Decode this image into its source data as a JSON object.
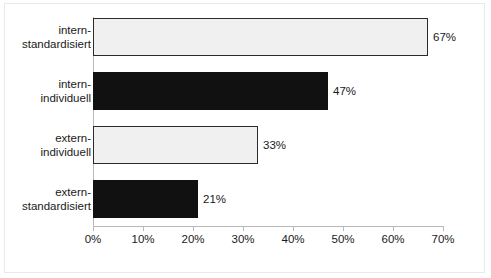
{
  "chart_data": {
    "type": "bar",
    "orientation": "horizontal",
    "title": "",
    "subtitle": "",
    "xlabel": "",
    "ylabel": "",
    "categories": [
      "intern-standardisiert",
      "intern-individuell",
      "extern-individuell",
      "extern-standardisiert"
    ],
    "category_lines": [
      [
        "intern-",
        "standardisiert"
      ],
      [
        "intern-",
        "individuell"
      ],
      [
        "extern-",
        "individuell"
      ],
      [
        "extern-",
        "standardisiert"
      ]
    ],
    "values": [
      67,
      47,
      33,
      21
    ],
    "value_labels": [
      "67%",
      "47%",
      "33%",
      "21%"
    ],
    "bar_styles": [
      "light",
      "dark",
      "light",
      "dark"
    ],
    "xlim": [
      0,
      70
    ],
    "xticks": [
      0,
      10,
      20,
      30,
      40,
      50,
      60,
      70
    ],
    "xtick_labels": [
      "0%",
      "10%",
      "20%",
      "30%",
      "40%",
      "50%",
      "60%",
      "70%"
    ],
    "grid": false,
    "legend": null,
    "colors": {
      "bar_light_fill": "#f0f0f0",
      "bar_light_border": "#2b2b2b",
      "bar_dark_fill": "#111111",
      "axis": "#b9b9b9",
      "frame": "#e9e9e9",
      "text": "#1a1a1a",
      "background": "#ffffff"
    }
  }
}
